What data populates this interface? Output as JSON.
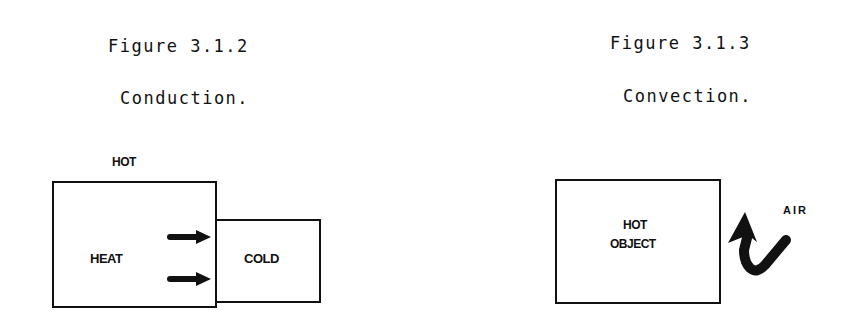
{
  "figures": [
    {
      "id": "conduction",
      "number_label": "Figure 3.1.2",
      "caption": "Conduction.",
      "labels": {
        "hot": "HOT",
        "heat": "HEAT",
        "cold": "COLD"
      },
      "arrows": [
        {
          "direction": "right",
          "meaning": "heat-flow"
        },
        {
          "direction": "right",
          "meaning": "heat-flow"
        }
      ]
    },
    {
      "id": "convection",
      "number_label": "Figure 3.1.3",
      "caption": "Convection.",
      "labels": {
        "object_line1": "HOT",
        "object_line2": "OBJECT",
        "air": "AIR"
      },
      "arrows": [
        {
          "direction": "up-curved",
          "meaning": "air-flow"
        }
      ]
    }
  ],
  "colors": {
    "ink": "#111111",
    "background": "#ffffff"
  }
}
